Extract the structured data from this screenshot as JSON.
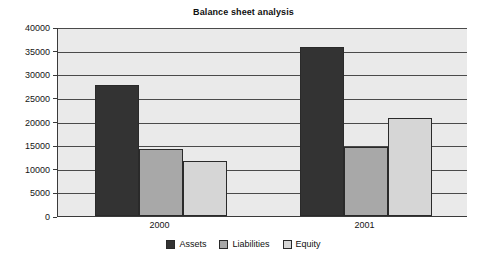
{
  "chart_data": {
    "type": "bar",
    "title": "Balance sheet analysis",
    "xlabel": "",
    "ylabel": "",
    "categories": [
      "2000",
      "2001"
    ],
    "series": [
      {
        "name": "Assets",
        "values": [
          27700,
          35800
        ],
        "color": "#333333"
      },
      {
        "name": "Liabilities",
        "values": [
          14100,
          14600
        ],
        "color": "#a8a8a8"
      },
      {
        "name": "Equity",
        "values": [
          11700,
          20800
        ],
        "color": "#d6d6d6"
      }
    ],
    "ylim": [
      0,
      40000
    ],
    "ytick_step": 5000,
    "ytick_labels": [
      "0",
      "5000",
      "10000",
      "15000",
      "20000",
      "25000",
      "30000",
      "35000",
      "40000"
    ],
    "grid": true,
    "legend_position": "bottom",
    "plot_background": "#eaeaea",
    "axis_color": "#3a3a3a",
    "bar_border_color": "#2a2a2a"
  }
}
